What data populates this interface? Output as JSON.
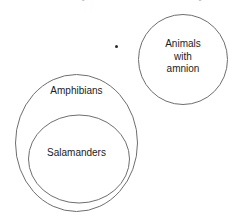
{
  "header": {
    "cut_off_text": "and so may be confident than the bay"
  },
  "diagram": {
    "type": "venn-euler",
    "bullet_marker": "•",
    "stroke_color": "#6e6e6e",
    "text_color": "#1b1b1b",
    "background": "#ffffff",
    "sets": [
      {
        "id": "amphibians",
        "label": "Amphibians",
        "shape": "circle",
        "cx": 76.5,
        "cy": 143,
        "rx": 61.5,
        "ry": 69,
        "contains": "salamanders"
      },
      {
        "id": "salamanders",
        "label": "Salamanders",
        "shape": "circle",
        "cx": 79,
        "cy": 159,
        "rx": 51,
        "ry": 44,
        "contains": null
      },
      {
        "id": "amnion",
        "label": "Animals\nwith\namnion",
        "label_lines": [
          "Animals",
          "with",
          "amnion"
        ],
        "shape": "circle",
        "cx": 183,
        "cy": 59.5,
        "rx": 45,
        "ry": 45,
        "contains": null
      }
    ],
    "labels": {
      "amphibians": "Amphibians",
      "salamanders": "Salamanders",
      "amnion_line1": "Animals",
      "amnion_line2": "with",
      "amnion_line3": "amnion"
    }
  }
}
